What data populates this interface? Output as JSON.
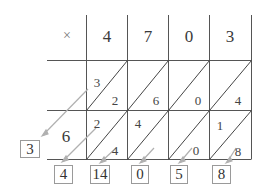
{
  "diagram": {
    "operator": "×",
    "multiplicand_digits": [
      "4",
      "7",
      "0",
      "3"
    ],
    "multiplier_digits": [
      "",
      "6"
    ],
    "cells": [
      [
        {
          "tens": "3",
          "ones": "2"
        },
        {
          "tens": "",
          "ones": "6"
        },
        {
          "tens": "",
          "ones": "0"
        },
        {
          "tens": "",
          "ones": "4"
        }
      ],
      [
        {
          "tens": "2",
          "ones": "4"
        },
        {
          "tens": "4",
          "ones": ""
        },
        {
          "tens": "",
          "ones": "0"
        },
        {
          "tens": "1",
          "ones": "8"
        }
      ]
    ],
    "result_left": "3",
    "result_bottom": [
      "4",
      "14",
      "0",
      "5",
      "8"
    ],
    "colors": {
      "grid_line": "#555555",
      "arrow": "#aaaaaa",
      "box_border": "#9a9a9a",
      "text": "#333333"
    }
  }
}
